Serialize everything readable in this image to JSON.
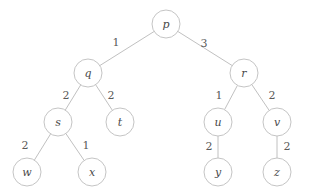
{
  "figure": {
    "background_color": "#ffffff",
    "node_stroke_color": "#bdbdbd",
    "edge_stroke_color": "#b9b9b9",
    "label_color": "#4a4a4a",
    "weight_color": "#5a5a5a",
    "node_radius": 14
  },
  "chart_data": {
    "type": "diagram",
    "diagram_kind": "weighted-binary-tree",
    "title": "",
    "root": "p",
    "nodes": [
      {
        "id": "p",
        "label": "p",
        "cx": 166,
        "cy": 24,
        "r": 14,
        "depth": 0
      },
      {
        "id": "q",
        "label": "q",
        "cx": 88,
        "cy": 73,
        "r": 14,
        "depth": 1
      },
      {
        "id": "r",
        "label": "r",
        "cx": 244,
        "cy": 73,
        "r": 14,
        "depth": 1
      },
      {
        "id": "s",
        "label": "s",
        "cx": 58,
        "cy": 122,
        "r": 14,
        "depth": 2
      },
      {
        "id": "t",
        "label": "t",
        "cx": 120,
        "cy": 122,
        "r": 14,
        "depth": 2
      },
      {
        "id": "u",
        "label": "u",
        "cx": 218,
        "cy": 122,
        "r": 14,
        "depth": 2
      },
      {
        "id": "v",
        "label": "v",
        "cx": 277,
        "cy": 122,
        "r": 14,
        "depth": 2
      },
      {
        "id": "w",
        "label": "w",
        "cx": 27,
        "cy": 172,
        "r": 14,
        "depth": 3
      },
      {
        "id": "x",
        "label": "x",
        "cx": 92,
        "cy": 172,
        "r": 14,
        "depth": 3
      },
      {
        "id": "y",
        "label": "y",
        "cx": 218,
        "cy": 172,
        "r": 14,
        "depth": 3
      },
      {
        "id": "z",
        "label": "z",
        "cx": 277,
        "cy": 172,
        "r": 14,
        "depth": 3
      }
    ],
    "edges": [
      {
        "from": "p",
        "to": "q",
        "weight": "1",
        "lx": 116,
        "ly": 42
      },
      {
        "from": "p",
        "to": "r",
        "weight": "3",
        "lx": 204,
        "ly": 43
      },
      {
        "from": "q",
        "to": "s",
        "weight": "2",
        "lx": 66,
        "ly": 95
      },
      {
        "from": "q",
        "to": "t",
        "weight": "2",
        "lx": 111,
        "ly": 95
      },
      {
        "from": "r",
        "to": "u",
        "weight": "1",
        "lx": 219,
        "ly": 95
      },
      {
        "from": "r",
        "to": "v",
        "weight": "2",
        "lx": 272,
        "ly": 95
      },
      {
        "from": "s",
        "to": "w",
        "weight": "2",
        "lx": 25,
        "ly": 145
      },
      {
        "from": "s",
        "to": "x",
        "weight": "1",
        "lx": 86,
        "ly": 145
      },
      {
        "from": "u",
        "to": "y",
        "weight": "2",
        "lx": 209,
        "ly": 146
      },
      {
        "from": "v",
        "to": "z",
        "weight": "2",
        "lx": 287,
        "ly": 146
      }
    ],
    "xlabel": "",
    "ylabel": "",
    "legend": []
  }
}
